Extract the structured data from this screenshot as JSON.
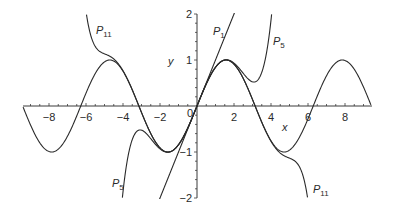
{
  "chart_data": {
    "type": "line",
    "title": "",
    "xlabel": "x",
    "ylabel": "y",
    "xlim": [
      -9.4,
      9.4
    ],
    "ylim": [
      -2,
      2
    ],
    "grid": false,
    "legend": "none (curves labeled inline)",
    "x_ticks": [
      -8,
      -6,
      -4,
      -2,
      2,
      4,
      6,
      8
    ],
    "x_tick_labels": [
      "−8",
      "−6",
      "−4",
      "−2",
      "2",
      "4",
      "6",
      "8"
    ],
    "y_ticks": [
      -2,
      -1,
      1,
      2
    ],
    "y_tick_labels": [
      "−2",
      "−1",
      "1",
      "2"
    ],
    "origin_label": "0",
    "series": [
      {
        "name": "sin x",
        "label": "",
        "function": "sin(x)",
        "coefficients": null
      },
      {
        "name": "P1",
        "label_main": "P",
        "label_sub": "1",
        "function": "x",
        "coefficients": [
          0,
          1
        ]
      },
      {
        "name": "P5",
        "label_main": "P",
        "label_sub": "5",
        "function": "x - x^3/6 + x^5/120",
        "coefficients": [
          0,
          1,
          0,
          -0.16666667,
          0,
          0.00833333
        ]
      },
      {
        "name": "P11",
        "label_main": "P",
        "label_sub": "11",
        "function": "x - x^3/3! + x^5/5! - x^7/7! + x^9/9! - x^11/11!",
        "coefficients": [
          0,
          1,
          0,
          -0.16666667,
          0,
          0.00833333,
          0,
          -0.000198413,
          0,
          2.75573e-06,
          0,
          -2.50521e-08
        ]
      }
    ],
    "annotations": [
      {
        "text": "P11",
        "x": -5.1,
        "y": 1.55
      },
      {
        "text": "P1",
        "x": 1.4,
        "y": 1.55
      },
      {
        "text": "P5",
        "x": 4.0,
        "y": 1.3
      },
      {
        "text": "P5",
        "x": -4.6,
        "y": -1.7
      },
      {
        "text": "P11",
        "x": 6.3,
        "y": -1.7
      }
    ]
  },
  "labels": {
    "x_axis": "x",
    "y_axis": "y",
    "origin": "0",
    "p11_top_main": "P",
    "p11_top_sub": "11",
    "p1_main": "P",
    "p1_sub": "1",
    "p5_top_main": "P",
    "p5_top_sub": "5",
    "p5_bottom_main": "P",
    "p5_bottom_sub": "5",
    "p11_bottom_main": "P",
    "p11_bottom_sub": "11"
  },
  "colors": {
    "curve": "#2a2a2a",
    "axis": "#3a3a3a",
    "background": "#ffffff"
  }
}
